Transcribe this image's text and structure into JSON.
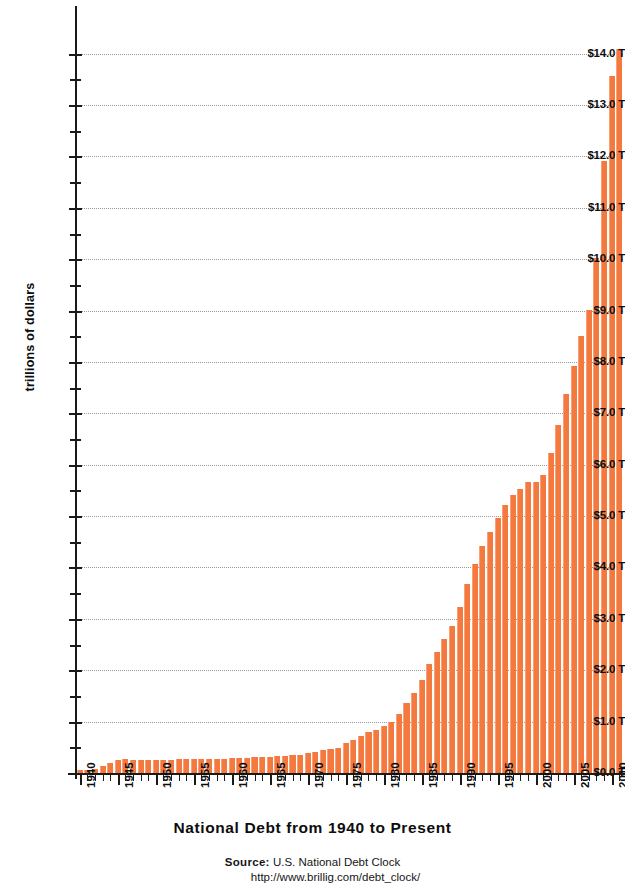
{
  "chart_data": {
    "type": "bar",
    "title": "National Debt from 1940 to Present",
    "xlabel": "",
    "ylabel": "trillions of dollars",
    "ylim": [
      0,
      14.5
    ],
    "xlim": [
      1940,
      2011
    ],
    "grid": true,
    "legend": null,
    "bar_color": "#f4793e",
    "y_tick_labels": [
      "$0.0 T",
      "$1.0 T",
      "$2.0 T",
      "$3.0 T",
      "$4.0 T",
      "$5.0 T",
      "$6.0 T",
      "$7.0 T",
      "$8.0 T",
      "$9.0 T",
      "$10.0 T",
      "$11.0 T",
      "$12.0 T",
      "$13.0 T",
      "$14.0 T"
    ],
    "y_tick_values": [
      0,
      1,
      2,
      3,
      4,
      5,
      6,
      7,
      8,
      9,
      10,
      11,
      12,
      13,
      14
    ],
    "y_minor_step": 0.5,
    "x_tick_labels": [
      "1940",
      "1945",
      "1950",
      "1955",
      "1960",
      "1965",
      "1970",
      "1975",
      "1980",
      "1985",
      "1990",
      "1995",
      "2000",
      "2005",
      "2010"
    ],
    "categories": [
      "1940",
      "1941",
      "1942",
      "1943",
      "1944",
      "1945",
      "1946",
      "1947",
      "1948",
      "1949",
      "1950",
      "1951",
      "1952",
      "1953",
      "1954",
      "1955",
      "1956",
      "1957",
      "1958",
      "1959",
      "1960",
      "1961",
      "1962",
      "1963",
      "1964",
      "1965",
      "1966",
      "1967",
      "1968",
      "1969",
      "1970",
      "1971",
      "1972",
      "1973",
      "1974",
      "1975",
      "1976",
      "1977",
      "1978",
      "1979",
      "1980",
      "1981",
      "1982",
      "1983",
      "1984",
      "1985",
      "1986",
      "1987",
      "1988",
      "1989",
      "1990",
      "1991",
      "1992",
      "1993",
      "1994",
      "1995",
      "1996",
      "1997",
      "1998",
      "1999",
      "2000",
      "2001",
      "2002",
      "2003",
      "2004",
      "2005",
      "2006",
      "2007",
      "2008",
      "2009",
      "2010",
      "2011"
    ],
    "values": [
      0.05,
      0.06,
      0.08,
      0.14,
      0.2,
      0.26,
      0.27,
      0.26,
      0.25,
      0.25,
      0.26,
      0.26,
      0.26,
      0.27,
      0.27,
      0.27,
      0.27,
      0.27,
      0.28,
      0.28,
      0.29,
      0.29,
      0.3,
      0.31,
      0.32,
      0.32,
      0.33,
      0.34,
      0.35,
      0.35,
      0.38,
      0.41,
      0.44,
      0.47,
      0.49,
      0.58,
      0.65,
      0.72,
      0.79,
      0.83,
      0.91,
      1.0,
      1.14,
      1.37,
      1.56,
      1.82,
      2.12,
      2.35,
      2.6,
      2.86,
      3.23,
      3.67,
      4.06,
      4.41,
      4.69,
      4.97,
      5.22,
      5.41,
      5.53,
      5.66,
      5.67,
      5.81,
      6.23,
      6.78,
      7.38,
      7.93,
      8.51,
      9.01,
      10.02,
      11.91,
      13.56,
      14.1
    ]
  },
  "source": {
    "keyword": "Source:",
    "name": "U.S. National Debt Clock",
    "url": "http://www.brillig.com/debt_clock/"
  }
}
